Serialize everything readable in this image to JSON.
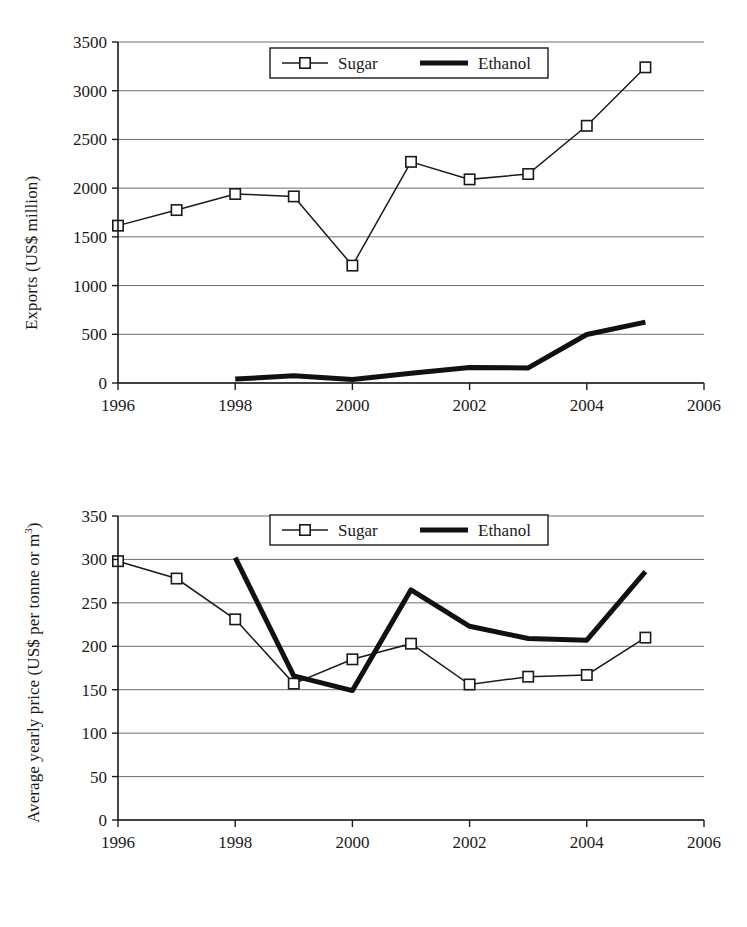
{
  "figure": {
    "panels": [
      "exports",
      "price"
    ]
  },
  "chart_data": [
    {
      "id": "exports",
      "type": "line",
      "title": "",
      "xlabel": "",
      "ylabel": "Exports (US$ million)",
      "x": [
        1996,
        1997,
        1998,
        1999,
        2000,
        2001,
        2002,
        2003,
        2004,
        2005
      ],
      "xlim": [
        1996,
        2006
      ],
      "ylim": [
        0,
        3500
      ],
      "xticks": [
        1996,
        1998,
        2000,
        2002,
        2004,
        2006
      ],
      "xticklabels": [
        "1996",
        "1998",
        "2000",
        "2002",
        "2004",
        "2006"
      ],
      "yticks": [
        0,
        500,
        1000,
        1500,
        2000,
        2500,
        3000,
        3500
      ],
      "yticklabels": [
        "0",
        "500",
        "1000",
        "1500",
        "2000",
        "2500",
        "3000",
        "3500"
      ],
      "grid": true,
      "legend_position": "upper-center",
      "series": [
        {
          "name": "Sugar",
          "marker": "square",
          "linewidth": "thin",
          "x": [
            1996,
            1997,
            1998,
            1999,
            2000,
            2001,
            2002,
            2003,
            2004,
            2005
          ],
          "values": [
            1615,
            1775,
            1940,
            1915,
            1205,
            2270,
            2090,
            2145,
            2640,
            3240
          ]
        },
        {
          "name": "Ethanol",
          "marker": "none",
          "linewidth": "thick",
          "x": [
            1998,
            1999,
            2000,
            2001,
            2002,
            2003,
            2004,
            2005
          ],
          "values": [
            40,
            75,
            35,
            100,
            160,
            155,
            498,
            625
          ]
        }
      ]
    },
    {
      "id": "price",
      "type": "line",
      "title": "",
      "xlabel": "",
      "ylabel": "Average yearly price (US$ per tonne or m3)",
      "ylabel_prefix": "Average yearly price (US$ per tonne or m",
      "ylabel_sup": "3",
      "ylabel_suffix": ")",
      "x": [
        1996,
        1997,
        1998,
        1999,
        2000,
        2001,
        2002,
        2003,
        2004,
        2005
      ],
      "xlim": [
        1996,
        2006
      ],
      "ylim": [
        0,
        350
      ],
      "xticks": [
        1996,
        1998,
        2000,
        2002,
        2004,
        2006
      ],
      "xticklabels": [
        "1996",
        "1998",
        "2000",
        "2002",
        "2004",
        "2006"
      ],
      "yticks": [
        0,
        50,
        100,
        150,
        200,
        250,
        300,
        350
      ],
      "yticklabels": [
        "0",
        "50",
        "100",
        "150",
        "200",
        "250",
        "300",
        "350"
      ],
      "grid": true,
      "legend_position": "upper-center",
      "series": [
        {
          "name": "Sugar",
          "marker": "square",
          "linewidth": "thin",
          "x": [
            1996,
            1997,
            1998,
            1999,
            2000,
            2001,
            2002,
            2003,
            2004,
            2005
          ],
          "values": [
            298,
            278,
            231,
            157,
            185,
            203,
            156,
            165,
            167,
            210
          ]
        },
        {
          "name": "Ethanol",
          "marker": "none",
          "linewidth": "thick",
          "x": [
            1998,
            1999,
            2000,
            2001,
            2002,
            2003,
            2004,
            2005
          ],
          "values": [
            302,
            166,
            149,
            265,
            223,
            209,
            207,
            286
          ]
        }
      ]
    }
  ],
  "legend": {
    "sugar_label": "Sugar",
    "ethanol_label": "Ethanol"
  },
  "colors": {
    "ink": "#1a1a1a",
    "grid": "#6e6e6e",
    "background": "#ffffff"
  }
}
